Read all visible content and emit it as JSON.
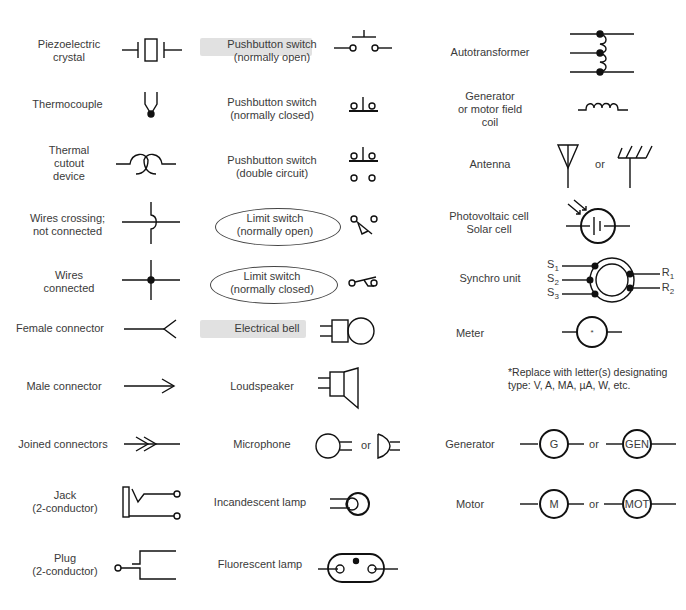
{
  "col1": [
    {
      "label": "Piezoelectric\ncrystal",
      "symbol": "piezoelectric-crystal"
    },
    {
      "label": "Thermocouple",
      "symbol": "thermocouple"
    },
    {
      "label": "Thermal\ncutout\ndevice",
      "symbol": "thermal-cutout"
    },
    {
      "label": "Wires crossing;\nnot connected",
      "symbol": "wires-crossing"
    },
    {
      "label": "Wires\nconnected",
      "symbol": "wires-connected"
    },
    {
      "label": "Female connector",
      "symbol": "female-connector"
    },
    {
      "label": "Male connector",
      "symbol": "male-connector"
    },
    {
      "label": "Joined connectors",
      "symbol": "joined-connectors"
    },
    {
      "label": "Jack\n(2-conductor)",
      "symbol": "jack"
    },
    {
      "label": "Plug\n(2-conductor)",
      "symbol": "plug"
    }
  ],
  "col2": [
    {
      "label": "Pushbutton switch\n(normally open)",
      "symbol": "pushbutton-no",
      "highlighted": true
    },
    {
      "label": "Pushbutton switch\n(normally closed)",
      "symbol": "pushbutton-nc"
    },
    {
      "label": "Pushbutton switch\n(double circuit)",
      "symbol": "pushbutton-double"
    },
    {
      "label": "Limit switch\n(normally open)",
      "symbol": "limit-switch-no",
      "circled": true
    },
    {
      "label": "Limit switch\n(normally closed)",
      "symbol": "limit-switch-nc",
      "circled": true
    },
    {
      "label": "Electrical bell",
      "symbol": "electrical-bell",
      "highlighted": true
    },
    {
      "label": "Loudspeaker",
      "symbol": "loudspeaker"
    },
    {
      "label": "Microphone",
      "symbol": "microphone"
    },
    {
      "label": "Incandescent lamp",
      "symbol": "incandescent-lamp"
    },
    {
      "label": "Fluorescent lamp",
      "symbol": "fluorescent-lamp"
    }
  ],
  "col3": [
    {
      "label": "Autotransformer",
      "symbol": "autotransformer"
    },
    {
      "label": "Generator\nor motor field\ncoil",
      "symbol": "field-coil"
    },
    {
      "label": "Antenna",
      "symbol": "antenna"
    },
    {
      "label": "Photovoltaic cell\nSolar cell",
      "symbol": "photovoltaic-cell"
    },
    {
      "label": "Synchro unit",
      "symbol": "synchro-unit"
    },
    {
      "label": "Meter",
      "symbol": "meter"
    },
    {
      "label": "Generator",
      "symbol": "generator"
    },
    {
      "label": "Motor",
      "symbol": "motor"
    }
  ],
  "or_text": "or",
  "meter_note": "*Replace with letter(s) designating\ntype: V, A, MA, µA, W, etc.",
  "meter_mark": "*",
  "synchro_labels": {
    "s1": "S",
    "s2": "S",
    "s3": "S",
    "r1": "R",
    "r2": "R",
    "sub1": "1",
    "sub2": "2",
    "sub3": "3"
  },
  "generator_letters": {
    "short": "G",
    "long": "GEN"
  },
  "motor_letters": {
    "short": "M",
    "long": "MOT"
  },
  "colors": {
    "line": "#111111",
    "text": "#3a3a3a",
    "highlight": "#d9d9d9"
  }
}
